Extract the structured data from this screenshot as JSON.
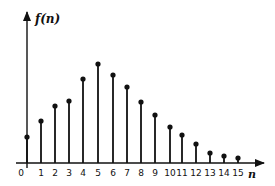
{
  "chart_data": {
    "type": "stem",
    "title": "",
    "xlabel": "n",
    "ylabel": "f(n)",
    "categories": [
      "0",
      "1",
      "2",
      "3",
      "4",
      "5",
      "6",
      "7",
      "8",
      "9",
      "10",
      "11",
      "12",
      "13",
      "14",
      "15"
    ],
    "x": [
      0,
      1,
      2,
      3,
      4,
      5,
      6,
      7,
      8,
      9,
      10,
      11,
      12,
      13,
      14,
      15
    ],
    "values": [
      26,
      42,
      57,
      62,
      84,
      99,
      88,
      76,
      61,
      48,
      36,
      28,
      19,
      10,
      7,
      5
    ],
    "value_units": "relative height (no y-axis tick labels shown)",
    "ylim": [
      0,
      100
    ],
    "grid": false,
    "legend": null,
    "y_ticks_shown": false
  },
  "axes": {
    "x_label": "n",
    "y_label": "f(n)",
    "origin_label": "0"
  },
  "colors": {
    "ink": "#111111",
    "background": "#ffffff"
  }
}
